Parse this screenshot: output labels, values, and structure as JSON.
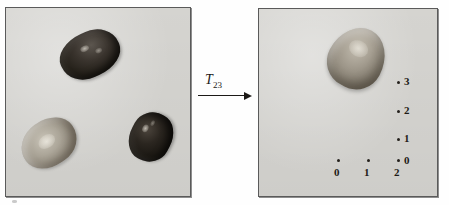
{
  "figure": {
    "caption_text": "",
    "background_color": "#fefefe",
    "panel_fill_color": "#d9d8d4",
    "panel_border_color": "#5a5a5a"
  },
  "transform": {
    "symbol": "T",
    "subscript": "23",
    "label_full": "T23",
    "arrow_direction": "right"
  },
  "left_panel": {
    "name": "source-image-panel",
    "seeds": [
      {
        "id": "seed-top-dark",
        "tone": "dark",
        "color": "#2b2620",
        "position": "top-center",
        "rotation_deg": -24
      },
      {
        "id": "seed-light-left",
        "tone": "light",
        "color": "#aaa497",
        "position": "bottom-left",
        "rotation_deg": -35
      },
      {
        "id": "seed-dark-right",
        "tone": "very-dark",
        "color": "#1a1712",
        "position": "bottom-right",
        "rotation_deg": -62
      }
    ]
  },
  "right_panel": {
    "name": "target-image-panel",
    "seeds": [
      {
        "id": "seed-right-main",
        "tone": "medium",
        "color": "#a49d90",
        "position": "top-center",
        "rotation_deg": 28
      }
    ],
    "axis": {
      "y_ticks": [
        {
          "label": "3",
          "dot_x": 138,
          "dot_y": 72,
          "label_x": 145,
          "label_y": 67
        },
        {
          "label": "2",
          "dot_x": 138,
          "dot_y": 101,
          "label_x": 145,
          "label_y": 96
        },
        {
          "label": "1",
          "dot_x": 138,
          "dot_y": 129,
          "label_x": 145,
          "label_y": 124
        },
        {
          "label": "0",
          "dot_x": 138,
          "dot_y": 150,
          "label_x": 145,
          "label_y": 146
        }
      ],
      "x_ticks": [
        {
          "label": "0",
          "dot_x": 78,
          "dot_y": 150,
          "label_x": 75,
          "label_y": 158
        },
        {
          "label": "1",
          "dot_x": 108,
          "dot_y": 150,
          "label_x": 105,
          "label_y": 158
        },
        {
          "label": "2",
          "dot_x": 138,
          "dot_y": 150,
          "label_x": 135,
          "label_y": 158
        }
      ]
    }
  }
}
